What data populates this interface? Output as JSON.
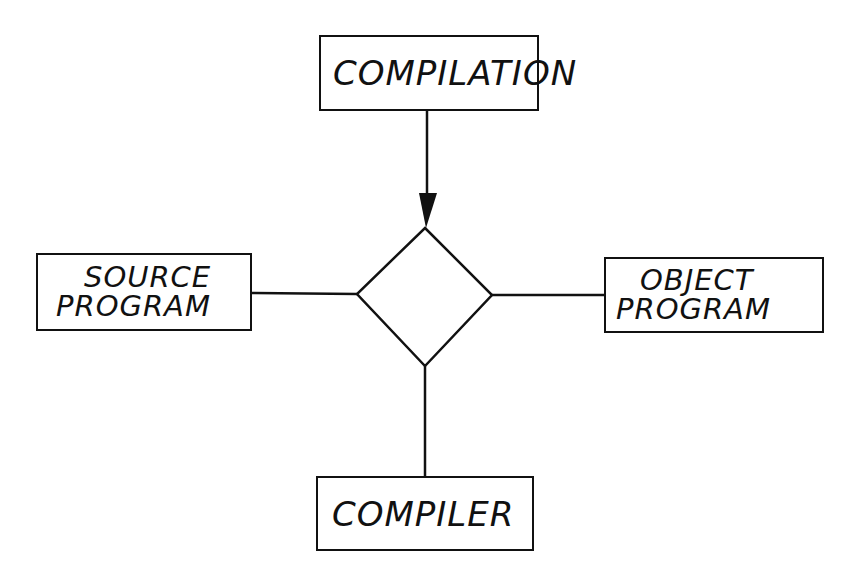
{
  "diagram": {
    "type": "entity-relationship",
    "relationship": {
      "shape": "diamond",
      "label": ""
    },
    "entities": {
      "top": {
        "lines": [
          "COMPILATION"
        ]
      },
      "left": {
        "lines": [
          "SOURCE",
          "PROGRAM"
        ]
      },
      "right": {
        "lines": [
          "OBJECT",
          "PROGRAM"
        ]
      },
      "bottom": {
        "lines": [
          "COMPILER"
        ]
      }
    },
    "connections": [
      {
        "from": "COMPILATION",
        "to": "relationship",
        "arrow": "to-relationship"
      },
      {
        "from": "SOURCE PROGRAM",
        "to": "relationship",
        "arrow": "none"
      },
      {
        "from": "relationship",
        "to": "OBJECT PROGRAM",
        "arrow": "none"
      },
      {
        "from": "relationship",
        "to": "COMPILER",
        "arrow": "none"
      }
    ],
    "colors": {
      "ink": "#111111",
      "background": "#ffffff"
    }
  }
}
